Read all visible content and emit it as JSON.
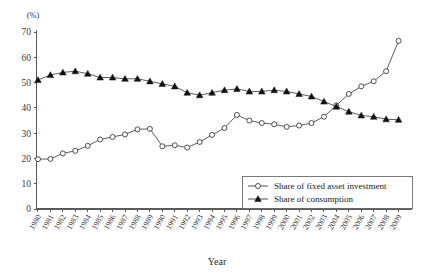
{
  "chart_data": {
    "type": "line",
    "title": "",
    "xlabel": "Year",
    "ylabel": "",
    "yunit": "(%)",
    "ylim": [
      0,
      70
    ],
    "yticks": [
      0,
      10,
      20,
      30,
      40,
      50,
      60,
      70
    ],
    "grid": false,
    "legend_position": "bottom-right",
    "categories": [
      "1980",
      "1981",
      "1982",
      "1983",
      "1984",
      "1985",
      "1986",
      "1987",
      "1988",
      "1989",
      "1990",
      "1991",
      "1992",
      "1993",
      "1994",
      "1995",
      "1996",
      "1997",
      "1998",
      "1999",
      "2000",
      "2001",
      "2002",
      "2003",
      "2004",
      "2005",
      "2006",
      "2007",
      "2008",
      "2009"
    ],
    "series": [
      {
        "name": "Share of fixed asset investment",
        "marker": "open-circle",
        "values": [
          19.7,
          19.8,
          22.0,
          23.0,
          25.0,
          27.5,
          28.5,
          29.5,
          31.5,
          31.7,
          24.8,
          25.2,
          24.3,
          26.5,
          29.3,
          32.0,
          37.2,
          35.0,
          34.0,
          33.5,
          32.5,
          33.0,
          34.0,
          36.5,
          41.0,
          45.5,
          48.5,
          50.5,
          54.5,
          66.5
        ]
      },
      {
        "name": "Share of consumption",
        "marker": "filled-triangle",
        "values": [
          51.0,
          53.0,
          54.0,
          54.5,
          53.5,
          52.0,
          52.0,
          51.5,
          51.5,
          50.5,
          49.5,
          48.5,
          46.0,
          45.0,
          46.0,
          47.0,
          47.5,
          46.5,
          46.5,
          47.0,
          46.5,
          45.5,
          44.5,
          42.5,
          40.5,
          38.5,
          37.0,
          36.5,
          35.5,
          35.3
        ]
      }
    ]
  },
  "legend": {
    "entries": [
      {
        "label": "Share of fixed asset investment"
      },
      {
        "label": "Share of consumption"
      }
    ]
  }
}
